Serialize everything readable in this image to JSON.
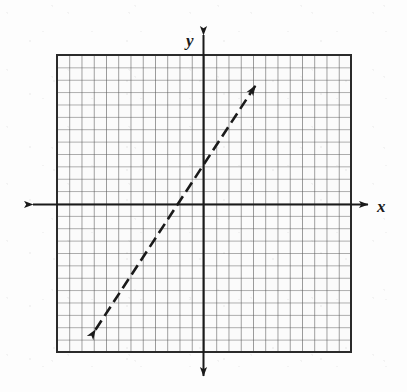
{
  "figure": {
    "kind": "coordinate-plane-graph",
    "width": 407,
    "height": 392,
    "background_color": "#fdfdfd",
    "ink_color": "#1a1a1a",
    "grid_color": "#555555"
  },
  "labels": {
    "x_axis": "x",
    "y_axis": "y"
  },
  "chart_data": {
    "type": "line",
    "title": "",
    "subtitle": "",
    "xlabel": "x",
    "ylabel": "y",
    "grid": true,
    "gridlines": {
      "minor_spacing_units": 1,
      "columns": 24,
      "rows": 24,
      "x_range_units": [
        -12,
        12
      ],
      "y_range_units": [
        -12,
        12
      ]
    },
    "legend": null,
    "annotations": [],
    "tick_labels": {
      "x": [],
      "y": []
    },
    "series": [
      {
        "name": "plotted-line",
        "style": "dashed",
        "arrow_both_ends": true,
        "description": "Dashed straight line with arrowheads at both ends rising left to right",
        "slope": 1.53,
        "y_intercept_units": 3.2,
        "x_intercept_units": -2.1,
        "endpoints_units": [
          {
            "x": -9.0,
            "y": -10.6
          },
          {
            "x": 4.5,
            "y": 10.0
          }
        ],
        "x": [
          -9.0,
          4.5
        ],
        "values": [
          -10.6,
          10.0
        ]
      }
    ],
    "axes": {
      "x_axis": {
        "arrow_left": true,
        "arrow_right": true,
        "extends_beyond_grid": true
      },
      "y_axis": {
        "arrow_up": true,
        "arrow_down": true,
        "extends_beyond_grid": true
      }
    }
  },
  "geometry_px": {
    "grid": {
      "left": 57,
      "top": 55,
      "right": 351,
      "bottom": 352,
      "cell": 12.25
    },
    "origin": {
      "x": 203,
      "y": 204
    },
    "x_axis_arrow_left_tip": {
      "x": 30,
      "y": 204
    },
    "x_axis_arrow_right_tip": {
      "x": 372,
      "y": 204
    },
    "y_axis_arrow_top_tip": {
      "x": 203,
      "y": 31
    },
    "y_axis_arrow_bottom_tip": {
      "x": 203,
      "y": 380
    },
    "dashed_line_start": {
      "x": 93,
      "y": 335
    },
    "dashed_line_end": {
      "x": 258,
      "y": 83
    }
  }
}
